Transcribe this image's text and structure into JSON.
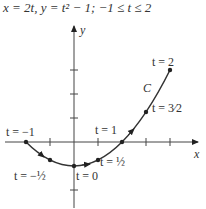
{
  "title": "x = 2t, y = t² − 1; −1 ≤ t ≤ 2",
  "axes": {
    "x_label": "x",
    "y_label": "y"
  },
  "curve_label": "C",
  "points": [
    {
      "t": "-1",
      "label": "t = −1"
    },
    {
      "t": "-1/2",
      "label": "t = −½"
    },
    {
      "t": "0",
      "label": "t = 0"
    },
    {
      "t": "1/2",
      "label": "t = ½"
    },
    {
      "t": "1",
      "label": "t = 1"
    },
    {
      "t": "3/2",
      "label": "t = 3⁄2"
    },
    {
      "t": "2",
      "label": "t = 2"
    }
  ],
  "colors": {
    "curve": "#333333",
    "axes": "#444444"
  }
}
